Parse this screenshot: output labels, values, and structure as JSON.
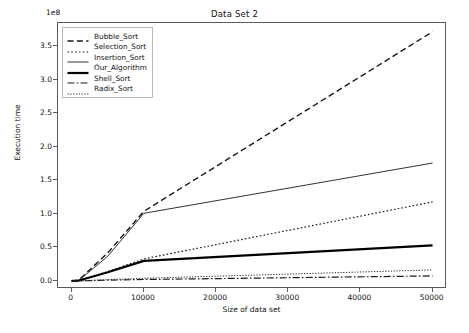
{
  "chart_data": {
    "type": "line",
    "title": "Data Set 2",
    "xlabel": "Size of data set",
    "ylabel": "Execution time",
    "y_offset_text": "1e8",
    "y_offset_value": 100000000,
    "xlim": [
      -1900,
      52000
    ],
    "ylim": [
      -0.12,
      3.85
    ],
    "xticks": [
      0,
      10000,
      20000,
      30000,
      40000,
      50000
    ],
    "xtick_labels": [
      "0",
      "10000",
      "20000",
      "30000",
      "40000",
      "50000"
    ],
    "yticks": [
      0.0,
      0.5,
      1.0,
      1.5,
      2.0,
      2.5,
      3.0,
      3.5
    ],
    "ytick_labels": [
      "0.0",
      "0.5",
      "1.0",
      "1.5",
      "2.0",
      "2.5",
      "3.0",
      "3.5"
    ],
    "grid": false,
    "legend_position": "upper left",
    "x": [
      0,
      1000,
      5000,
      10000,
      50000
    ],
    "series": [
      {
        "name": "Bubble_Sort",
        "style": "dashed",
        "width": 1.4,
        "color": "#1a1a1a",
        "values": [
          0.0,
          0.015,
          0.42,
          1.04,
          3.72
        ]
      },
      {
        "name": "Selection_Sort",
        "style": "dotted",
        "width": 1.2,
        "color": "#1a1a1a",
        "values": [
          0.0,
          0.008,
          0.14,
          0.33,
          1.18
        ]
      },
      {
        "name": "Insertion_Sort",
        "style": "solid",
        "width": 0.9,
        "color": "#1a1a1a",
        "values": [
          0.0,
          0.01,
          0.37,
          1.01,
          1.76
        ]
      },
      {
        "name": "Our_Algorithm",
        "style": "solid",
        "width": 2.2,
        "color": "#000000",
        "values": [
          0.0,
          0.006,
          0.13,
          0.3,
          0.53
        ]
      },
      {
        "name": "Shell_Sort",
        "style": "dashdot",
        "width": 1.2,
        "color": "#1a1a1a",
        "values": [
          0.0,
          0.001,
          0.012,
          0.022,
          0.075
        ]
      },
      {
        "name": "Radix_Sort",
        "style": "densely-dotted",
        "width": 0.9,
        "color": "#1a1a1a",
        "values": [
          0.0,
          0.002,
          0.02,
          0.04,
          0.165
        ]
      }
    ]
  }
}
